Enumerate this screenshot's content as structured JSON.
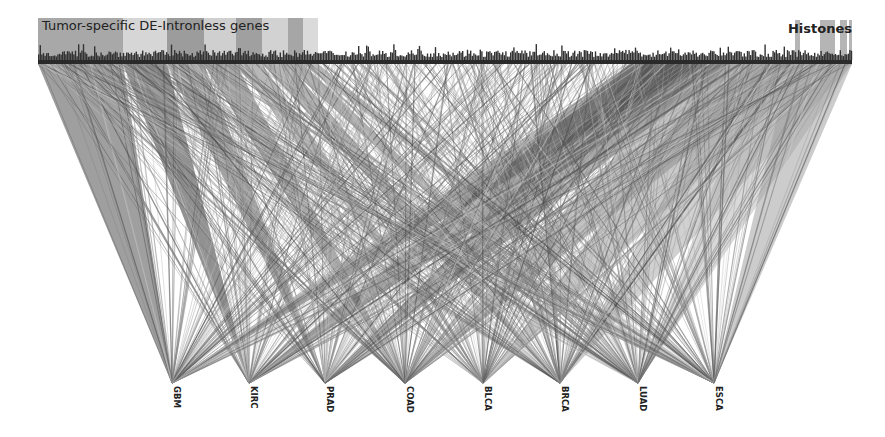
{
  "figure": {
    "type": "bipartite gene-to-tumor link diagram",
    "colors": {
      "background": "#ffffff",
      "link_light": "#b8b8b8",
      "link_mid": "#8c8c8c",
      "link_dark": "#3c3c3c",
      "bar": "#2e2e2e",
      "label": "#222222"
    },
    "top_axis": {
      "groups": [
        {
          "label": "Tumor-specific DE-Intronless genes",
          "x0": 38,
          "x1": 318
        },
        {
          "label": "Histones",
          "x0": 795,
          "x1": 852
        }
      ],
      "label_bands": [
        {
          "x0": 38,
          "x1": 123,
          "shade": "#a8a8a8"
        },
        {
          "x0": 123,
          "x1": 167,
          "shade": "#d6d6d6"
        },
        {
          "x0": 167,
          "x1": 204,
          "shade": "#9c9c9c"
        },
        {
          "x0": 204,
          "x1": 236,
          "shade": "#cfcfcf"
        },
        {
          "x0": 236,
          "x1": 262,
          "shade": "#a0a0a0"
        },
        {
          "x0": 262,
          "x1": 288,
          "shade": "#d2d2d2"
        },
        {
          "x0": 288,
          "x1": 303,
          "shade": "#a6a6a6"
        },
        {
          "x0": 303,
          "x1": 318,
          "shade": "#dadada"
        }
      ],
      "histone_bands": [
        {
          "x0": 795,
          "x1": 800
        },
        {
          "x0": 820,
          "x1": 835
        },
        {
          "x0": 840,
          "x1": 847
        },
        {
          "x0": 849,
          "x1": 852
        }
      ]
    },
    "tumor_nodes": [
      {
        "label": "GBM",
        "x": 172
      },
      {
        "label": "KIRC",
        "x": 249
      },
      {
        "label": "PRAD",
        "x": 325
      },
      {
        "label": "COAD",
        "x": 405
      },
      {
        "label": "BLCA",
        "x": 483
      },
      {
        "label": "BRCA",
        "x": 560
      },
      {
        "label": "LUAD",
        "x": 638
      },
      {
        "label": "ESCA",
        "x": 714
      }
    ]
  }
}
